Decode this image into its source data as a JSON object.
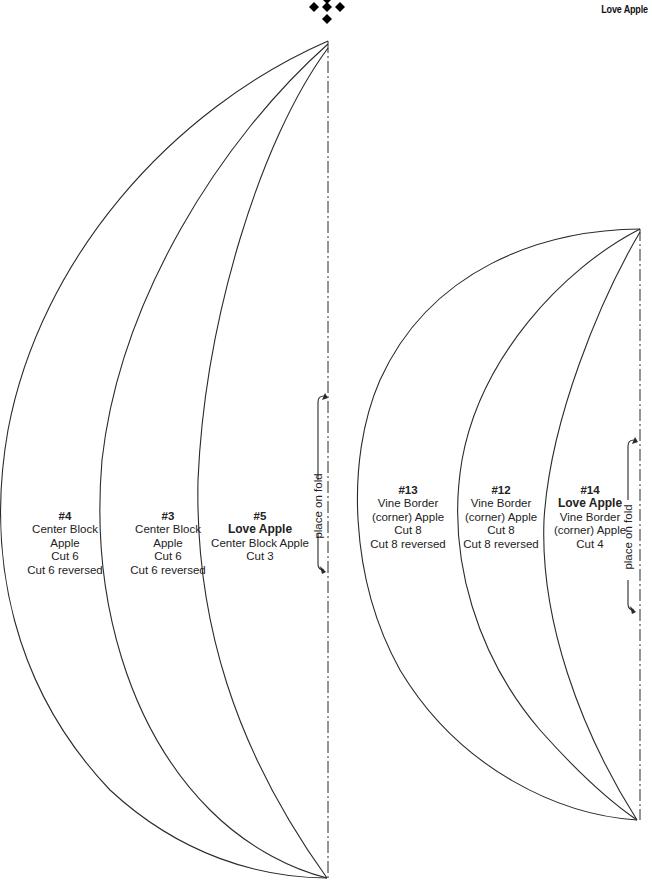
{
  "header": {
    "title": "Love Apple",
    "logo_icon": "four-diamond-ornament-icon"
  },
  "colors": {
    "line": "#2a2a2a",
    "text": "#222222",
    "background": "#ffffff"
  },
  "left_pattern": {
    "fold_label": "place on fold",
    "pieces": [
      {
        "id": "#4",
        "lines": [
          "Center Block",
          "Apple",
          "Cut 6",
          "Cut 6 reversed"
        ]
      },
      {
        "id": "#3",
        "lines": [
          "Center Block",
          "Apple",
          "Cut 6",
          "Cut 6 reversed"
        ]
      },
      {
        "id": "#5",
        "bold": "Love Apple",
        "lines": [
          "Center Block Apple",
          "Cut 3"
        ]
      }
    ]
  },
  "right_pattern": {
    "fold_label": "place on fold",
    "pieces": [
      {
        "id": "#13",
        "lines": [
          "Vine Border",
          "(corner) Apple",
          "Cut 8",
          "Cut 8 reversed"
        ]
      },
      {
        "id": "#12",
        "lines": [
          "Vine Border",
          "(corner) Apple",
          "Cut 8",
          "Cut 8 reversed"
        ]
      },
      {
        "id": "#14",
        "bold": "Love Apple",
        "lines": [
          "Vine Border",
          "(corner) Apple",
          "Cut 4"
        ]
      }
    ]
  }
}
